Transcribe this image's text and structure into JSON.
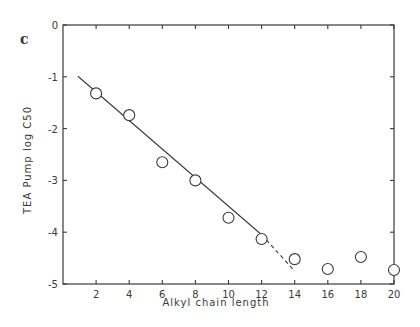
{
  "panel_label": "c",
  "chart_data": {
    "type": "scatter",
    "title": "",
    "xlabel": "Alkyl chain length",
    "ylabel": "TEA Pump log C50",
    "xlim": [
      0,
      20
    ],
    "ylim": [
      -5,
      0
    ],
    "x_ticks": [
      2,
      4,
      6,
      8,
      10,
      12,
      14,
      16,
      18,
      20
    ],
    "y_ticks": [
      0,
      -1,
      -2,
      -3,
      -4,
      -5
    ],
    "x_tick_labels": [
      "2",
      "4",
      "6",
      "8",
      "10",
      "12",
      "14",
      "16",
      "18",
      "20"
    ],
    "y_tick_labels": [
      "0",
      "-1",
      "-2",
      "-3",
      "-4",
      "-5"
    ],
    "grid": false,
    "legend": null,
    "series": [
      {
        "name": "TEA Pump log C50",
        "marker": "open-circle",
        "x": [
          2,
          4,
          6,
          8,
          10,
          12,
          14,
          16,
          18,
          20
        ],
        "y": [
          -1.32,
          -1.74,
          -2.65,
          -3.0,
          -3.72,
          -4.13,
          -4.52,
          -4.71,
          -4.48,
          -4.73
        ]
      }
    ],
    "fit_line": {
      "solid": {
        "x": [
          0.9,
          12
        ],
        "y": [
          -0.99,
          -4.05
        ]
      },
      "dashed": {
        "x": [
          12,
          14
        ],
        "y": [
          -4.05,
          -4.75
        ]
      }
    }
  },
  "colors": {
    "ink": "#3a3a3a",
    "background": "#ffffff"
  }
}
